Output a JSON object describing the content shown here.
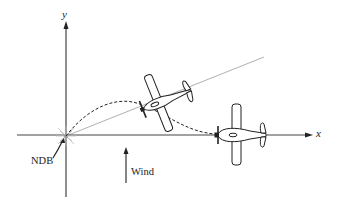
{
  "diagram": {
    "type": "navigation-diagram",
    "axes": {
      "x_label": "x",
      "y_label": "y"
    },
    "beacon": {
      "label": "NDB"
    },
    "wind": {
      "label": "Wind",
      "direction": "up"
    },
    "aircraft": [
      {
        "id": "plane-1",
        "heading": "toward NDB along bearing line",
        "position": "upper-middle"
      },
      {
        "id": "plane-2",
        "heading": "toward -x along x-axis",
        "position": "on x-axis right"
      }
    ],
    "paths": [
      {
        "id": "path-1",
        "style": "dashed",
        "from": "NDB",
        "to": "plane-1"
      },
      {
        "id": "path-2",
        "style": "dashed",
        "from": "plane-1",
        "to": "plane-2"
      },
      {
        "id": "bearing-line",
        "style": "solid-gray",
        "from": "NDB",
        "to": "upper-right"
      }
    ],
    "colors": {
      "line": "#222222",
      "bearing": "#aaaaaa",
      "background": "#ffffff"
    }
  }
}
